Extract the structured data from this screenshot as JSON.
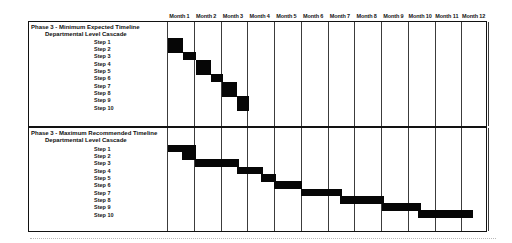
{
  "page": {
    "background": "#ffffff",
    "bar_color": "#060606",
    "grid_line_color": "#3c3c3c"
  },
  "chart_data": {
    "type": "bar",
    "subtype": "gantt-cascade",
    "grid": true,
    "bar_color": "#000000",
    "x_unit": "months",
    "x_range_months": [
      0,
      12
    ],
    "months": [
      "Month 1",
      "Month 2",
      "Month 3",
      "Month 4",
      "Month 5",
      "Month 6",
      "Month 7",
      "Month 8",
      "Month 9",
      "Month 10",
      "Month 11",
      "Month 12"
    ],
    "sections": [
      {
        "title": "Phase 3 - Minimum Expected Timeline",
        "subtitle": "Departmental Level Cascade",
        "steps": [
          {
            "label": "Step 1",
            "start_month": 0.05,
            "end_month": 0.6
          },
          {
            "label": "Step 2",
            "start_month": 0.05,
            "end_month": 0.6
          },
          {
            "label": "Step 3",
            "start_month": 0.6,
            "end_month": 1.08
          },
          {
            "label": "Step 4",
            "start_month": 1.08,
            "end_month": 1.65
          },
          {
            "label": "Step 5",
            "start_month": 1.08,
            "end_month": 1.65
          },
          {
            "label": "Step 6",
            "start_month": 1.63,
            "end_month": 2.08
          },
          {
            "label": "Step 7",
            "start_month": 2.05,
            "end_month": 2.6
          },
          {
            "label": "Step 8",
            "start_month": 2.05,
            "end_month": 2.6
          },
          {
            "label": "Step 9",
            "start_month": 2.6,
            "end_month": 3.08
          },
          {
            "label": "Step 10",
            "start_month": 2.6,
            "end_month": 3.08
          }
        ]
      },
      {
        "title": "Phase 3 - Maximum Recommended Timeline",
        "subtitle": "Departmental Level Cascade",
        "steps": [
          {
            "label": "Step 1",
            "start_month": 0.05,
            "end_month": 1.08
          },
          {
            "label": "Step 2",
            "start_month": 0.55,
            "end_month": 1.08
          },
          {
            "label": "Step 3",
            "start_month": 1.05,
            "end_month": 2.68
          },
          {
            "label": "Step 4",
            "start_month": 2.63,
            "end_month": 3.58
          },
          {
            "label": "Step 5",
            "start_month": 3.53,
            "end_month": 4.08
          },
          {
            "label": "Step 6",
            "start_month": 4.0,
            "end_month": 5.05
          },
          {
            "label": "Step 7",
            "start_month": 5.0,
            "end_month": 6.53
          },
          {
            "label": "Step 8",
            "start_month": 6.45,
            "end_month": 8.13
          },
          {
            "label": "Step 9",
            "start_month": 8.05,
            "end_month": 9.5
          },
          {
            "label": "Step 10",
            "start_month": 9.4,
            "end_month": 11.45
          }
        ]
      }
    ]
  }
}
